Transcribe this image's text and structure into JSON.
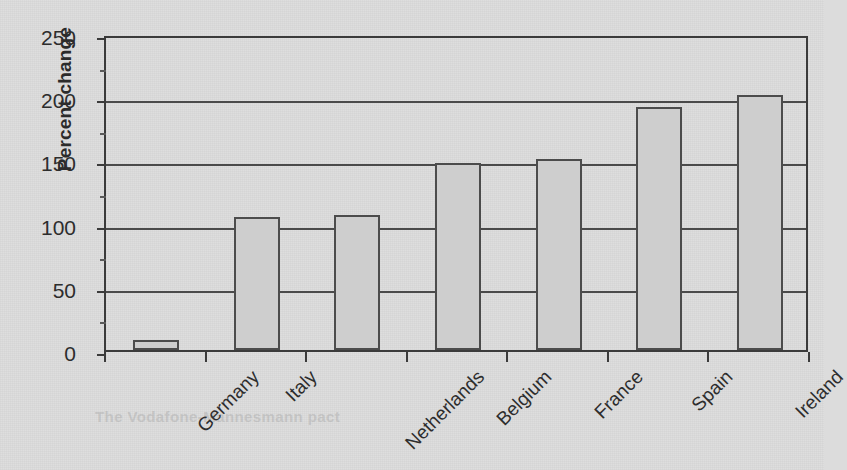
{
  "chart_data": {
    "type": "bar",
    "title": "",
    "xlabel": "",
    "ylabel": "Percent change",
    "categories": [
      "Germany",
      "Italy",
      "Netherlands",
      "Belgium",
      "France",
      "Spain",
      "Ireland"
    ],
    "values": [
      8,
      105,
      107,
      148,
      151,
      192,
      202
    ],
    "ylim": [
      0,
      250
    ],
    "yticks": [
      0,
      50,
      100,
      150,
      200,
      250
    ],
    "ytick_labels": [
      "0",
      "50",
      "100",
      "150",
      "200",
      "250"
    ],
    "grid": "horizontal",
    "legend": "none",
    "bar_fill_color": "#cecece",
    "bar_border_color": "#4c4c4c",
    "axis_color": "#3a3a3a",
    "background_color": "#dcdcdc"
  },
  "axis": {
    "y_title": "Percent change"
  },
  "scan": {
    "bleed_text": "The Vodafone-Mannesmann pact"
  }
}
